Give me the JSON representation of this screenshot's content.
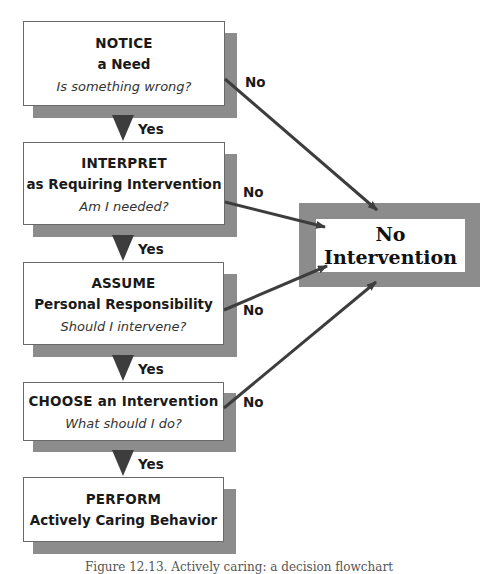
{
  "diagram": {
    "type": "flowchart",
    "steps": [
      {
        "title": "NOTICE",
        "subtitle": "a Need",
        "question": "Is something wrong?"
      },
      {
        "title": "INTERPRET",
        "subtitle": "as Requiring Intervention",
        "question": "Am I needed?"
      },
      {
        "title": "ASSUME",
        "subtitle": "Personal Responsibility",
        "question": "Should I intervene?"
      },
      {
        "title": "CHOOSE an Intervention",
        "question": "What should I do?"
      },
      {
        "title": "PERFORM",
        "subtitle": "Actively Caring Behavior"
      }
    ],
    "yes_labels": [
      "Yes",
      "Yes",
      "Yes",
      "Yes"
    ],
    "no_labels": [
      "No",
      "No",
      "No",
      "No"
    ],
    "outcome": {
      "line1": "No",
      "line2": "Intervention"
    },
    "colors": {
      "shadow": "#8c8c8c",
      "arrow": "#3d3d3d",
      "box_border": "#6a6a6a"
    }
  },
  "caption": "Figure 12.13. Actively caring: a decision flowchart"
}
